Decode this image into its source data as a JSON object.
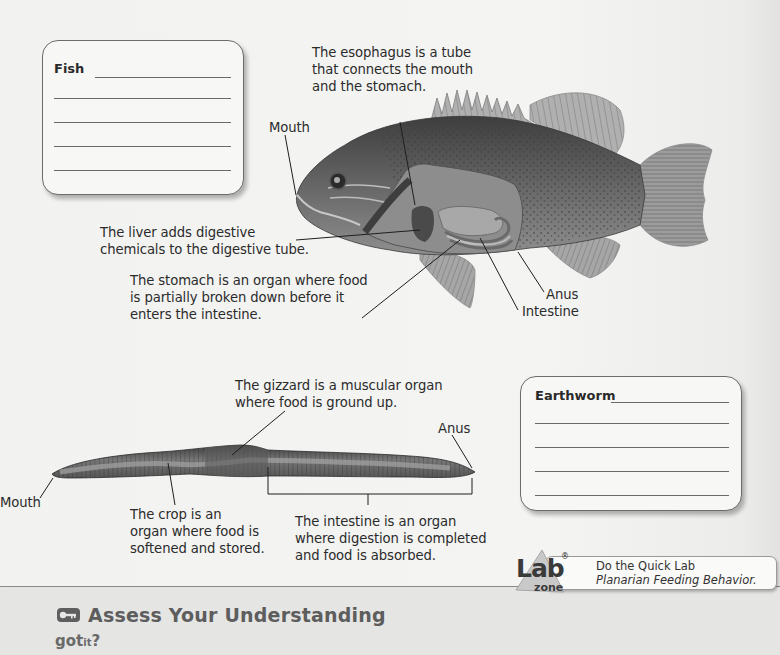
{
  "fish_section": {
    "note_box": {
      "title": "Fish",
      "blank_lines": 6
    },
    "labels": {
      "esophagus": [
        "The esophagus is a tube",
        "that connects the mouth",
        "and the stomach."
      ],
      "mouth": "Mouth",
      "liver": [
        "The liver adds digestive",
        "chemicals to the digestive tube."
      ],
      "stomach": [
        "The stomach is an organ where food",
        "is partially broken down before it",
        "enters the intestine."
      ],
      "anus": "Anus",
      "intestine": "Intestine"
    }
  },
  "earthworm_section": {
    "note_box": {
      "title": "Earthworm",
      "blank_lines": 5
    },
    "labels": {
      "gizzard": [
        "The gizzard is a muscular organ",
        "where food is ground up."
      ],
      "anus": "Anus",
      "mouth": "Mouth",
      "crop": [
        "The crop is an",
        "organ where food is",
        "softened and stored."
      ],
      "intestine": [
        "The intestine is an organ",
        "where digestion is completed",
        "and food is absorbed."
      ]
    }
  },
  "lab_zone": {
    "logo_main": "Lab",
    "logo_sub": "zone",
    "logo_mark": "®",
    "line1": "Do the Quick Lab",
    "line2": "Planarian Feeding Behavior."
  },
  "assess": {
    "icon": "key-icon",
    "title": "Assess Your Understanding",
    "got": "got",
    "it": "it",
    "q": "?"
  },
  "colors": {
    "page_bg": "#f2f2f1",
    "band_bg": "#e5e5e4",
    "text": "#2b2b2b",
    "heading_gray": "#5d5d5d"
  }
}
